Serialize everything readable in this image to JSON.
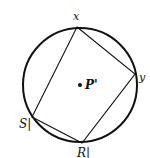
{
  "diagram": {
    "type": "inscribed-quadrilateral",
    "circle": {
      "cx": 80,
      "cy": 85,
      "r": 57,
      "stroke": "#111111",
      "stroke_width": 2
    },
    "center": {
      "x": 80,
      "y": 85,
      "label": "P'"
    },
    "vertices": [
      {
        "id": "x",
        "label": "x",
        "x": 77,
        "y": 27
      },
      {
        "id": "y",
        "label": "y",
        "x": 135,
        "y": 74
      },
      {
        "id": "R",
        "label": "R|",
        "x": 82,
        "y": 143
      },
      {
        "id": "S",
        "label": "S|",
        "x": 32,
        "y": 117
      }
    ],
    "edges": [
      [
        "x",
        "y"
      ],
      [
        "y",
        "R"
      ],
      [
        "R",
        "S"
      ],
      [
        "S",
        "x"
      ]
    ],
    "line_color": "#111111"
  }
}
